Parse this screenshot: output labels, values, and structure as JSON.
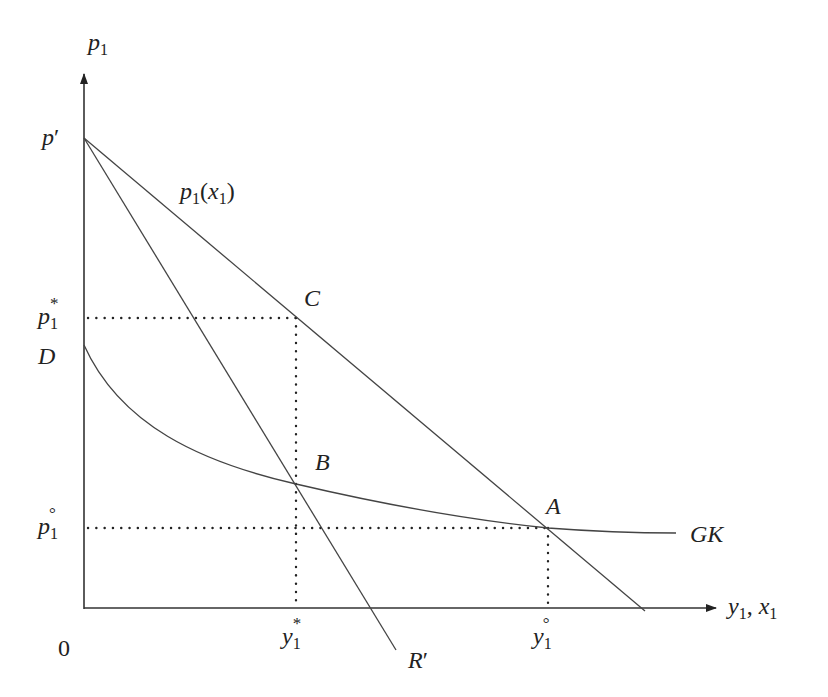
{
  "diagram": {
    "axes": {
      "y_label": {
        "base": "p",
        "sub": "1"
      },
      "x_label": {
        "y_base": "y",
        "y_sub": "1",
        "sep": ",",
        "x_base": "x",
        "x_sub": "1"
      },
      "origin": "0"
    },
    "price_labels": {
      "p_prime": {
        "base": "p",
        "mark": "′"
      },
      "p_star": {
        "base": "p",
        "sub": "1",
        "sup": "*"
      },
      "p_circ": {
        "base": "p",
        "sub": "1",
        "sup": "°"
      },
      "D": "D"
    },
    "quantity_labels": {
      "y_star": {
        "base": "y",
        "sub": "1",
        "sup": "*"
      },
      "y_circ": {
        "base": "y",
        "sub": "1",
        "sup": "°"
      }
    },
    "curves": {
      "demand": {
        "base": "p",
        "sub": "1",
        "open": "(",
        "arg": "x",
        "arg_sub": "1",
        "close": ")"
      },
      "marginal_revenue": {
        "base": "R",
        "mark": "′"
      },
      "average_cost": "GK"
    },
    "points": {
      "A": "A",
      "B": "B",
      "C": "C"
    },
    "colors": {
      "line": "#444444",
      "axis": "#333333",
      "text": "#222222",
      "background": "#ffffff"
    }
  }
}
